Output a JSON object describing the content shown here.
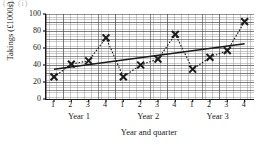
{
  "fragment_text": "(a) (i)",
  "chart_data": {
    "type": "line",
    "title": "",
    "xlabel": "Year and quarter",
    "ylabel": "Takings (£1000s)",
    "ylim": [
      0,
      100
    ],
    "yticks": [
      0,
      20,
      40,
      60,
      80,
      100
    ],
    "ytick_labels": [
      "0",
      "20",
      "40",
      "60",
      "80",
      "100"
    ],
    "grid": true,
    "legend": "none",
    "marker": "cross",
    "x": [
      1,
      2,
      3,
      4,
      5,
      6,
      7,
      8,
      9,
      10,
      11,
      12
    ],
    "quarter_labels": [
      "1",
      "2",
      "3",
      "4",
      "1",
      "2",
      "3",
      "4",
      "1",
      "2",
      "3",
      "4"
    ],
    "group_labels": [
      "Year 1",
      "Year 2",
      "Year 3"
    ],
    "series": [
      {
        "name": "Takings",
        "style": "dashed",
        "values": [
          26,
          41,
          45,
          72,
          26,
          40,
          47,
          76,
          35,
          49,
          57,
          91
        ]
      },
      {
        "name": "Trend line",
        "style": "solid",
        "x": [
          1,
          12
        ],
        "values": [
          35,
          65
        ]
      }
    ],
    "colors": {
      "data": "#1a1a1a",
      "trend": "#1a1a1a",
      "grid_major": "#3c3c3c",
      "grid_minor": "#828282",
      "axis": "#1a1a1a"
    }
  }
}
